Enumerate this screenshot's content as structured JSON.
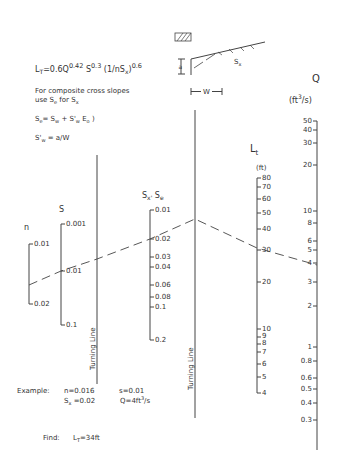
{
  "formula": {
    "main": "L",
    "main_sub": "T",
    "main_rest": "=0.6Q",
    "exp1": "0.42",
    "s_label": " S",
    "exp2": "0.3",
    "paren": " (1/nS",
    "paren_sub": "x",
    "paren_close": ")",
    "exp3": "0.6"
  },
  "notes": {
    "line1": "For composite cross slopes",
    "line2a": "use S",
    "line2sub": "e",
    "line2b": " for S",
    "line2sub2": "x",
    "se_eq": "S",
    "se_sub": "e",
    "se_rest": "= S",
    "se_rest_sub": "w",
    "se_plus": " + S'",
    "se_plus_sub": "w",
    "se_e": " E",
    "se_e_sub": "o",
    "se_end": " )",
    "sw_eq": "S'",
    "sw_sub": "w",
    "sw_rest": " = a/W"
  },
  "inset": {
    "sx_label": "S",
    "sx_sub": "x",
    "a_label": "a",
    "w_label": "W"
  },
  "scales": {
    "n": {
      "title": "n",
      "ticks": [
        "0.01",
        "0.02"
      ]
    },
    "s": {
      "title": "S",
      "ticks": [
        "0.001",
        "0.01",
        "0.1"
      ]
    },
    "turning1": {
      "label": "Turning Line"
    },
    "sx": {
      "title": "S",
      "title_sub": "x'",
      "title2": " S",
      "title2_sub": "e",
      "ticks": [
        "0.01",
        "0.02",
        "0.03",
        "0.04",
        "0.06",
        "0.08",
        "0.1",
        "0.2"
      ]
    },
    "turning2": {
      "label": "Turning Line"
    },
    "lt": {
      "title": "L",
      "title_sub": "t",
      "unit": "(ft)",
      "ticks": [
        "80",
        "70",
        "60",
        "50",
        "40",
        "30",
        "20",
        "10",
        "9",
        "8",
        "7",
        "6",
        "5",
        "4"
      ]
    },
    "q": {
      "title": "Q",
      "unit_a": "(ft",
      "unit_sup": "3",
      "unit_b": "/s)",
      "ticks": [
        "50",
        "40",
        "30",
        "20",
        "10",
        "8",
        "6",
        "5",
        "4",
        "3",
        "2",
        "1",
        "0.8",
        "0.6",
        "0.5",
        "0.4",
        "0.3"
      ]
    }
  },
  "example": {
    "label": "Example:",
    "n": "n=0.016",
    "s": "s=0.01",
    "sx": "S",
    "sx_sub": "x",
    "sx_val": " =0.02",
    "q": "Q=4ft",
    "q_sup": "3",
    "q_end": "/s"
  },
  "find": {
    "label": "Find:",
    "result": "L",
    "result_sub": "T",
    "result_val": "=34ft"
  }
}
